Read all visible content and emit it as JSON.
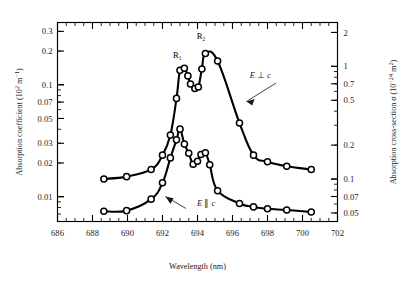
{
  "chart_data": {
    "type": "line",
    "title": "",
    "xlabel": "Wavelength (nm)",
    "ylabel": "Absorption coefficient (10² m⁻¹)",
    "y2label": "Absorption cross-section σ (10⁻²⁴ m²)",
    "xscale": "linear",
    "yscale": "log",
    "xlim": [
      686,
      702
    ],
    "ylim": [
      0.006,
      0.36
    ],
    "y2lim": [
      0.042,
      2.45
    ],
    "grid": false,
    "legend_position": "inline-annotations",
    "xticks": [
      686,
      688,
      690,
      692,
      694,
      696,
      698,
      700,
      702
    ],
    "xticklabels": [
      "686",
      "688",
      "690",
      "692",
      "694",
      "696",
      "698",
      "700",
      "702"
    ],
    "xminor_step": 0.5,
    "yticks": [
      0.01,
      0.02,
      0.03,
      0.05,
      0.07,
      0.1,
      0.2,
      0.3
    ],
    "yticklabels": [
      "0.01",
      "0.02",
      "0.03",
      "0.05",
      "0.07",
      "0.1",
      "0.2",
      "0.3"
    ],
    "y2ticks": [
      0.05,
      0.07,
      0.1,
      0.2,
      0.5,
      0.7,
      1,
      2
    ],
    "y2ticklabels": [
      "0.05",
      "0.07",
      "0.1",
      "0.2",
      "0.5",
      "0.7",
      "1",
      "2"
    ],
    "annotations": [
      {
        "text": "R₁",
        "x": 692.85,
        "y": 0.175,
        "name": "peak-label-r1"
      },
      {
        "text": "R₂",
        "x": 694.2,
        "y": 0.255,
        "name": "peak-label-r2"
      },
      {
        "text": "E ⊥ c",
        "x": 697.6,
        "y": 0.115,
        "name": "series-label-e-perp-c"
      },
      {
        "text": "E ∥ c",
        "x": 694.5,
        "y": 0.0082,
        "name": "series-label-e-par-c"
      }
    ],
    "series": [
      {
        "name": "E ⊥ c",
        "marker": "open-circle",
        "x": [
          688.65,
          689.95,
          691.35,
          692.0,
          692.45,
          692.8,
          693.0,
          693.25,
          693.45,
          693.6,
          693.85,
          694.05,
          694.25,
          694.45,
          695.15,
          696.4,
          697.2,
          698.0,
          699.1,
          700.5
        ],
        "y": [
          0.0144,
          0.0151,
          0.0175,
          0.0235,
          0.0355,
          0.0755,
          0.1345,
          0.1405,
          0.12,
          0.1015,
          0.0925,
          0.0955,
          0.1385,
          0.19,
          0.163,
          0.0455,
          0.0235,
          0.0205,
          0.0187,
          0.0175
        ]
      },
      {
        "name": "E ∥ c",
        "marker": "open-circle",
        "x": [
          688.65,
          689.95,
          691.35,
          692.0,
          692.45,
          692.8,
          693.0,
          693.25,
          693.5,
          693.75,
          694.0,
          694.2,
          694.45,
          694.7,
          695.15,
          696.4,
          697.2,
          698.0,
          699.1,
          700.5
        ],
        "y": [
          0.0074,
          0.0075,
          0.0095,
          0.0133,
          0.0222,
          0.0322,
          0.0401,
          0.0295,
          0.0244,
          0.0195,
          0.0207,
          0.0238,
          0.0247,
          0.0193,
          0.0113,
          0.0087,
          0.0081,
          0.0078,
          0.0076,
          0.0073
        ]
      }
    ]
  }
}
